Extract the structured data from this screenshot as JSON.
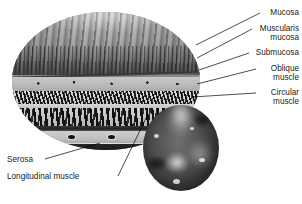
{
  "figure": {
    "type": "anatomical-cross-section",
    "style": "grayscale medical illustration"
  },
  "labels_right": [
    {
      "id": "mucosa",
      "text": "Mucosa",
      "text2": "",
      "top": 8,
      "leader": {
        "x1": 260,
        "y1": 13,
        "x2": 196,
        "y2": 45
      }
    },
    {
      "id": "muscularis-mucosa",
      "text": "Muscularis",
      "text2": "mucosa",
      "top": 24,
      "leader": {
        "x1": 252,
        "y1": 29,
        "x2": 197,
        "y2": 58
      }
    },
    {
      "id": "submucosa",
      "text": "Submucosa",
      "text2": "",
      "top": 48,
      "leader": {
        "x1": 249,
        "y1": 53,
        "x2": 199,
        "y2": 70
      }
    },
    {
      "id": "oblique-muscle",
      "text": "Oblique",
      "text2": "muscle",
      "top": 64,
      "leader": {
        "x1": 256,
        "y1": 69,
        "x2": 197,
        "y2": 84
      }
    },
    {
      "id": "circular-muscle",
      "text": "Circular",
      "text2": "muscle",
      "top": 88,
      "leader": {
        "x1": 256,
        "y1": 93,
        "x2": 192,
        "y2": 97
      }
    }
  ],
  "labels_left": [
    {
      "id": "serosa",
      "text": "Serosa",
      "top": 155,
      "left": 7,
      "leader": {
        "x1": 45,
        "y1": 159,
        "x2": 100,
        "y2": 143
      }
    },
    {
      "id": "longitudinal-muscle",
      "text": "Longitudinal muscle",
      "top": 172,
      "left": 7,
      "leader": {
        "x1": 118,
        "y1": 176,
        "x2": 148,
        "y2": 114
      }
    }
  ],
  "layers": [
    {
      "id": "mucosa",
      "name": "Mucosa",
      "tone": "#8d8d8d"
    },
    {
      "id": "muscularis-mucosa",
      "name": "Muscularis mucosa",
      "tone": "#2a2a2a"
    },
    {
      "id": "submucosa",
      "name": "Submucosa",
      "tone": "#c8c8c8"
    },
    {
      "id": "oblique-muscle",
      "name": "Oblique muscle",
      "tone": "#151515"
    },
    {
      "id": "circular-muscle",
      "name": "Circular muscle",
      "tone": "#111111"
    },
    {
      "id": "longitudinal-muscle",
      "name": "Longitudinal muscle",
      "tone": "#cfcfcf"
    },
    {
      "id": "serosa",
      "name": "Serosa",
      "tone": "#141414"
    }
  ],
  "inset": {
    "id": "endoscopic-view",
    "name": "Endoscopic view of gastric mucosa"
  },
  "colors": {
    "background": "#ffffff",
    "text": "#1a1a1a",
    "leader": "#000000"
  }
}
